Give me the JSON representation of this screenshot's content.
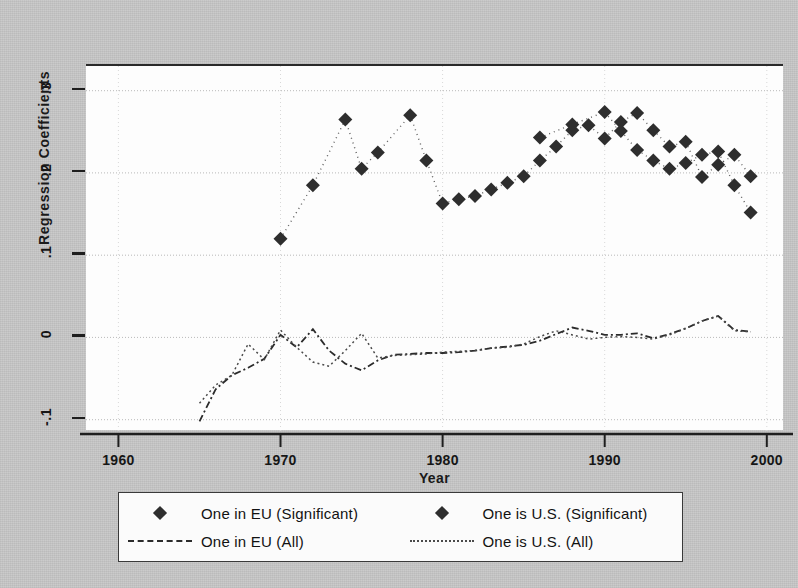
{
  "chart_data": {
    "type": "scatter",
    "title": "",
    "xlabel": "Year",
    "ylabel": "Regression Coefficients",
    "xlim": [
      1958,
      2001
    ],
    "ylim": [
      -0.115,
      0.33
    ],
    "xticks": [
      1960,
      1970,
      1980,
      1990,
      2000
    ],
    "xtick_labels": [
      "1960",
      "1970",
      "1980",
      "1990",
      "2000"
    ],
    "yticks": [
      -0.1,
      0,
      0.1,
      0.2,
      0.3
    ],
    "ytick_labels": [
      "-.1",
      "0",
      ".1",
      ".2",
      ".3"
    ],
    "grid": true,
    "grid_axis": "both",
    "legend_position": "below",
    "series": [
      {
        "name": "One in EU (Significant)",
        "marker": "diamond",
        "style": "markers",
        "color": "#2e2e2e",
        "x": [
          1970,
          1972,
          1974,
          1975,
          1976,
          1978,
          1979,
          1980,
          1981,
          1982,
          1983,
          1984,
          1985,
          1986,
          1987,
          1988,
          1989,
          1990,
          1991,
          1992,
          1993,
          1994,
          1995,
          1996,
          1997,
          1998,
          1999
        ],
        "y": [
          0.12,
          0.185,
          0.265,
          0.205,
          0.225,
          0.27,
          0.215,
          0.163,
          0.168,
          0.172,
          0.18,
          0.188,
          0.196,
          0.215,
          0.232,
          0.252,
          0.258,
          0.242,
          0.262,
          0.273,
          0.252,
          0.232,
          0.238,
          0.195,
          0.21,
          0.222,
          0.196
        ]
      },
      {
        "name": "One is U.S. (Significant)",
        "marker": "diamond",
        "style": "markers",
        "color": "#2e2e2e",
        "x": [
          1986,
          1988,
          1990,
          1991,
          1992,
          1993,
          1994,
          1995,
          1996,
          1997,
          1998,
          1999
        ],
        "y": [
          0.243,
          0.259,
          0.274,
          0.251,
          0.228,
          0.215,
          0.205,
          0.212,
          0.222,
          0.226,
          0.185,
          0.152
        ]
      },
      {
        "name": "One in EU (All)",
        "style": "dash-dot-line",
        "color": "#2b2b2b",
        "x": [
          1965,
          1966,
          1967,
          1968,
          1969,
          1970,
          1971,
          1972,
          1973,
          1974,
          1975,
          1976,
          1977,
          1978,
          1979,
          1980,
          1981,
          1982,
          1983,
          1984,
          1985,
          1986,
          1987,
          1988,
          1989,
          1990,
          1991,
          1992,
          1993,
          1994,
          1995,
          1996,
          1997,
          1998,
          1999
        ],
        "y": [
          -0.102,
          -0.063,
          -0.046,
          -0.037,
          -0.026,
          0.003,
          -0.012,
          0.01,
          -0.016,
          -0.032,
          -0.04,
          -0.028,
          -0.021,
          -0.02,
          -0.019,
          -0.019,
          -0.018,
          -0.016,
          -0.013,
          -0.011,
          -0.009,
          -0.004,
          0.004,
          0.012,
          0.008,
          0.003,
          0.003,
          0.005,
          -0.001,
          0.004,
          0.011,
          0.02,
          0.026,
          0.009,
          0.007
        ]
      },
      {
        "name": "One is U.S. (All)",
        "style": "fine-dash-line",
        "color": "#4a4a4a",
        "x": [
          1965,
          1966,
          1967,
          1968,
          1969,
          1970,
          1971,
          1972,
          1973,
          1974,
          1975,
          1976,
          1977,
          1978,
          1979,
          1980,
          1981,
          1982,
          1983,
          1984,
          1985,
          1986,
          1987,
          1988,
          1989,
          1990,
          1991,
          1992,
          1993,
          1994,
          1995,
          1996,
          1997,
          1998,
          1999
        ],
        "y": [
          -0.08,
          -0.058,
          -0.046,
          -0.008,
          -0.027,
          0.009,
          -0.012,
          -0.03,
          -0.035,
          -0.016,
          0.005,
          -0.025,
          -0.022,
          -0.021,
          -0.02,
          -0.018,
          -0.017,
          -0.016,
          -0.013,
          -0.012,
          -0.008,
          0.001,
          0.008,
          0.003,
          -0.002,
          0.0,
          0.001,
          0.0,
          -0.002,
          0.003,
          0.011,
          0.02,
          0.026,
          0.008,
          0.007
        ]
      }
    ]
  },
  "axes": {
    "y_title": "Regression Coefficients",
    "x_title": "Year"
  },
  "legend": {
    "left": [
      {
        "key": "diamond",
        "label": "One in EU (Significant)"
      },
      {
        "key": "dash",
        "label": "One in EU (All)"
      }
    ],
    "right": [
      {
        "key": "diamond",
        "label": "One is U.S. (Significant)"
      },
      {
        "key": "fine-dash",
        "label": "One is U.S. (All)"
      }
    ]
  },
  "icons": {
    "diamond": "diamond-marker-icon",
    "dash": "dashed-line-icon",
    "fine_dash": "fine-dashed-line-icon"
  }
}
